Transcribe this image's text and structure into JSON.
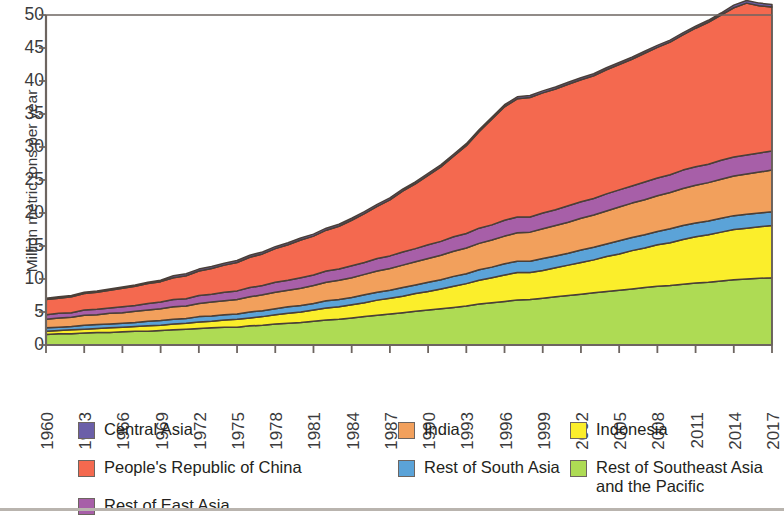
{
  "chart_data": {
    "type": "area",
    "stacked": true,
    "title": "",
    "subtitle": "",
    "xlabel": "",
    "ylabel": "Million metric tons per year",
    "xlim": [
      1960,
      2017
    ],
    "ylim": [
      0,
      50
    ],
    "y_ticks": [
      0,
      5,
      10,
      15,
      20,
      25,
      30,
      35,
      40,
      45,
      50
    ],
    "x_ticks": [
      1960,
      1963,
      1966,
      1969,
      1972,
      1975,
      1978,
      1981,
      1984,
      1987,
      1990,
      1993,
      1996,
      1999,
      2002,
      2005,
      2008,
      2011,
      2014,
      2017
    ],
    "grid": false,
    "legend_position": "bottom",
    "x": [
      1960,
      1961,
      1962,
      1963,
      1964,
      1965,
      1966,
      1967,
      1968,
      1969,
      1970,
      1971,
      1972,
      1973,
      1974,
      1975,
      1976,
      1977,
      1978,
      1979,
      1980,
      1981,
      1982,
      1983,
      1984,
      1985,
      1986,
      1987,
      1988,
      1989,
      1990,
      1991,
      1992,
      1993,
      1994,
      1995,
      1996,
      1997,
      1998,
      1999,
      2000,
      2001,
      2002,
      2003,
      2004,
      2005,
      2006,
      2007,
      2008,
      2009,
      2010,
      2011,
      2012,
      2013,
      2014,
      2015,
      2016,
      2017
    ],
    "series": [
      {
        "name": "Rest of Southeast Asia and the Pacific",
        "color": "#AEDB54",
        "values": [
          1.6,
          1.7,
          1.7,
          1.8,
          1.9,
          1.9,
          2.0,
          2.1,
          2.1,
          2.2,
          2.3,
          2.4,
          2.5,
          2.6,
          2.7,
          2.7,
          2.9,
          3.0,
          3.2,
          3.3,
          3.4,
          3.6,
          3.8,
          3.9,
          4.1,
          4.3,
          4.5,
          4.7,
          4.9,
          5.1,
          5.3,
          5.5,
          5.7,
          5.9,
          6.2,
          6.4,
          6.6,
          6.8,
          6.9,
          7.1,
          7.3,
          7.5,
          7.7,
          7.9,
          8.1,
          8.3,
          8.5,
          8.7,
          8.9,
          9.0,
          9.2,
          9.4,
          9.5,
          9.7,
          9.9,
          10.0,
          10.1,
          10.2
        ]
      },
      {
        "name": "Indonesia",
        "color": "#FBEE2B",
        "values": [
          0.5,
          0.5,
          0.6,
          0.6,
          0.6,
          0.7,
          0.7,
          0.7,
          0.8,
          0.8,
          0.9,
          0.9,
          1.0,
          1.0,
          1.1,
          1.2,
          1.2,
          1.3,
          1.4,
          1.5,
          1.6,
          1.7,
          1.8,
          1.9,
          2.0,
          2.1,
          2.3,
          2.4,
          2.5,
          2.7,
          2.8,
          3.0,
          3.2,
          3.4,
          3.6,
          3.8,
          4.0,
          4.2,
          4.1,
          4.2,
          4.4,
          4.6,
          4.8,
          5.0,
          5.3,
          5.5,
          5.8,
          6.0,
          6.3,
          6.5,
          6.8,
          7.0,
          7.2,
          7.4,
          7.6,
          7.7,
          7.8,
          7.9
        ]
      },
      {
        "name": "Rest of South Asia",
        "color": "#5BA3D8",
        "values": [
          0.5,
          0.5,
          0.5,
          0.6,
          0.6,
          0.6,
          0.6,
          0.6,
          0.7,
          0.7,
          0.7,
          0.7,
          0.8,
          0.8,
          0.8,
          0.8,
          0.9,
          0.9,
          0.9,
          1.0,
          1.0,
          1.0,
          1.1,
          1.1,
          1.1,
          1.2,
          1.2,
          1.2,
          1.3,
          1.3,
          1.4,
          1.4,
          1.5,
          1.5,
          1.6,
          1.6,
          1.7,
          1.7,
          1.7,
          1.8,
          1.8,
          1.8,
          1.9,
          1.9,
          1.9,
          2.0,
          2.0,
          2.0,
          2.0,
          2.1,
          2.1,
          2.1,
          2.1,
          2.1,
          2.1,
          2.1,
          2.1,
          2.1
        ]
      },
      {
        "name": "India",
        "color": "#F2A05C",
        "values": [
          1.3,
          1.4,
          1.4,
          1.5,
          1.5,
          1.6,
          1.6,
          1.7,
          1.7,
          1.8,
          1.9,
          1.9,
          2.0,
          2.1,
          2.1,
          2.2,
          2.3,
          2.4,
          2.5,
          2.5,
          2.6,
          2.7,
          2.8,
          2.9,
          3.0,
          3.1,
          3.2,
          3.3,
          3.4,
          3.5,
          3.6,
          3.7,
          3.8,
          3.9,
          4.0,
          4.1,
          4.2,
          4.3,
          4.4,
          4.5,
          4.6,
          4.7,
          4.8,
          4.9,
          5.0,
          5.1,
          5.2,
          5.3,
          5.4,
          5.5,
          5.6,
          5.7,
          5.8,
          5.9,
          6.0,
          6.1,
          6.2,
          6.3
        ]
      },
      {
        "name": "Rest of East Asia",
        "color": "#A75FA8",
        "values": [
          0.7,
          0.7,
          0.7,
          0.8,
          0.8,
          0.8,
          0.9,
          0.9,
          1.0,
          1.0,
          1.1,
          1.1,
          1.2,
          1.2,
          1.3,
          1.3,
          1.4,
          1.4,
          1.5,
          1.5,
          1.6,
          1.6,
          1.7,
          1.7,
          1.8,
          1.8,
          1.9,
          1.9,
          2.0,
          2.0,
          2.1,
          2.1,
          2.2,
          2.2,
          2.3,
          2.3,
          2.4,
          2.4,
          2.3,
          2.4,
          2.4,
          2.5,
          2.5,
          2.5,
          2.6,
          2.6,
          2.6,
          2.7,
          2.7,
          2.7,
          2.8,
          2.8,
          2.8,
          2.9,
          2.9,
          2.9,
          2.9,
          2.9
        ]
      },
      {
        "name": "People's Republic of China",
        "color": "#F4694F",
        "values": [
          2.3,
          2.3,
          2.4,
          2.5,
          2.6,
          2.7,
          2.8,
          2.9,
          3.0,
          3.1,
          3.3,
          3.5,
          3.7,
          3.9,
          4.1,
          4.3,
          4.6,
          4.8,
          5.1,
          5.4,
          5.7,
          5.9,
          6.2,
          6.5,
          6.9,
          7.4,
          7.9,
          8.5,
          9.2,
          9.8,
          10.5,
          11.3,
          12.2,
          13.3,
          14.6,
          16.0,
          17.2,
          17.9,
          18.1,
          18.2,
          18.3,
          18.4,
          18.5,
          18.6,
          18.8,
          19.0,
          19.2,
          19.5,
          19.8,
          20.1,
          20.5,
          21.0,
          21.5,
          22.0,
          22.6,
          23.0,
          22.3,
          21.8
        ]
      },
      {
        "name": "Central Asia",
        "color": "#6B5FA8",
        "values": [
          0.2,
          0.2,
          0.2,
          0.2,
          0.2,
          0.2,
          0.2,
          0.2,
          0.2,
          0.2,
          0.3,
          0.3,
          0.3,
          0.3,
          0.3,
          0.3,
          0.3,
          0.3,
          0.3,
          0.3,
          0.3,
          0.3,
          0.3,
          0.3,
          0.3,
          0.3,
          0.3,
          0.3,
          0.3,
          0.3,
          0.3,
          0.3,
          0.3,
          0.3,
          0.3,
          0.3,
          0.3,
          0.3,
          0.3,
          0.3,
          0.3,
          0.3,
          0.3,
          0.3,
          0.3,
          0.3,
          0.3,
          0.3,
          0.3,
          0.3,
          0.3,
          0.3,
          0.3,
          0.3,
          0.4,
          0.4,
          0.4,
          0.4
        ]
      }
    ]
  },
  "axes": {
    "y_title": "Million metric tons per year",
    "y_tick_labels": [
      "50",
      "45",
      "40",
      "35",
      "30",
      "25",
      "20",
      "15",
      "10",
      "5",
      "0"
    ],
    "x_tick_labels": [
      "1960",
      "1963",
      "1966",
      "1969",
      "1972",
      "1975",
      "1978",
      "1981",
      "1984",
      "1987",
      "1990",
      "1993",
      "1996",
      "1999",
      "2002",
      "2005",
      "2008",
      "2011",
      "2014",
      "2017"
    ]
  },
  "legend": {
    "items": [
      {
        "label": "Central Asia",
        "color": "#6B5FA8",
        "col": 0,
        "row": 0
      },
      {
        "label": "People's Republic of China",
        "color": "#F4694F",
        "col": 0,
        "row": 1
      },
      {
        "label": "Rest of East Asia",
        "color": "#A75FA8",
        "col": 0,
        "row": 2
      },
      {
        "label": "India",
        "color": "#F2A05C",
        "col": 1,
        "row": 0
      },
      {
        "label": "Rest of South Asia",
        "color": "#5BA3D8",
        "col": 1,
        "row": 1
      },
      {
        "label": "Indonesia",
        "color": "#FBEE2B",
        "col": 2,
        "row": 0
      },
      {
        "label": "Rest of Southeast Asia\nand the Pacific",
        "color": "#AEDB54",
        "col": 2,
        "row": 1
      }
    ]
  },
  "colors": {
    "axis": "#6d6560",
    "outline": "#4a3f38",
    "text": "#231f20"
  }
}
